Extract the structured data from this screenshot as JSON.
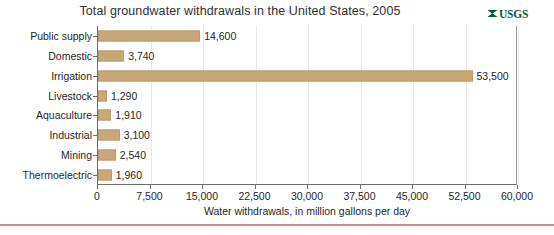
{
  "logo": {
    "name": "usgs-logo",
    "text": "USGS",
    "color": "#00583d"
  },
  "chart_data": {
    "type": "bar",
    "orientation": "horizontal",
    "title": "Total groundwater withdrawals in the United States, 2005",
    "xlabel": "Water withdrawals, in million gallons per day",
    "ylabel": "",
    "categories": [
      "Public supply",
      "Domestic",
      "Irrigation",
      "Livestock",
      "Aquaculture",
      "Industrial",
      "Mining",
      "Thermoelectric"
    ],
    "values": [
      14600,
      3740,
      53500,
      1290,
      1910,
      3100,
      2540,
      1960
    ],
    "value_labels": [
      "14,600",
      "3,740",
      "53,500",
      "1,290",
      "1,910",
      "3,100",
      "2,540",
      "1,960"
    ],
    "xlim": [
      0,
      60000
    ],
    "xticks": [
      0,
      7500,
      15000,
      22500,
      30000,
      37500,
      45000,
      52500,
      60000
    ],
    "xtick_labels": [
      "0",
      "7,500",
      "15,000",
      "22,500",
      "30,000",
      "37,500",
      "45,000",
      "52,500",
      "60,000"
    ],
    "grid": true,
    "grid_axis": "x",
    "legend": false,
    "bar_color": "#c8a878",
    "bar_edge_color": "#b99a6c"
  }
}
